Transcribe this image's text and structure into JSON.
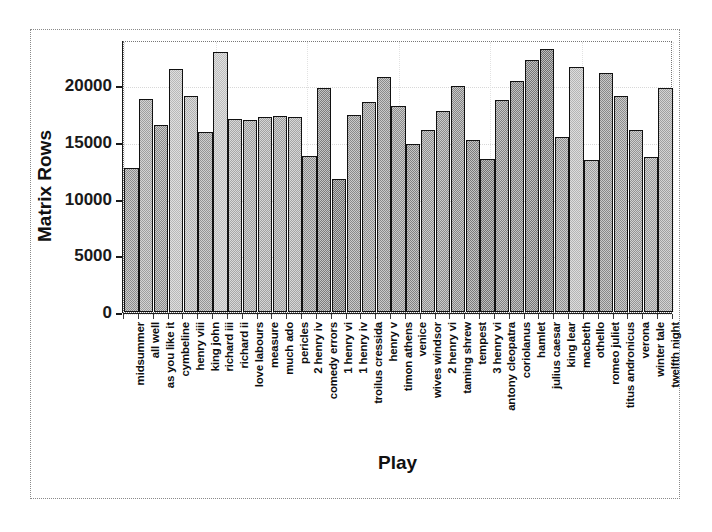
{
  "chart_data": {
    "type": "bar",
    "title": "",
    "xlabel": "Play",
    "ylabel": "Matrix Rows",
    "ylim": [
      0,
      24000
    ],
    "yticks": [
      0,
      5000,
      10000,
      15000,
      20000
    ],
    "ytick_labels": [
      "0",
      "5000",
      "10000",
      "15000",
      "20000"
    ],
    "grid": true,
    "legend": null,
    "categories": [
      "midsummer",
      "all well",
      "as you like it",
      "cymbeline",
      "henry viii",
      "king john",
      "richard iii",
      "richard ii",
      "love labours",
      "measure",
      "much ado",
      "pericles",
      "2 henry iv",
      "comedy errors",
      "1 henry vi",
      "1 henry iv",
      "troilus cressida",
      "henry v",
      "timon athens",
      "venice",
      "wives windsor",
      "2 henry vi",
      "taming shrew",
      "tempest",
      "3 henry vi",
      "antony cleopatra",
      "coriolanus",
      "hamlet",
      "julius caesar",
      "king lear",
      "macbeth",
      "othello",
      "romeo juliet",
      "titus andronicus",
      "verona",
      "winter tale",
      "twelfth night"
    ],
    "values": [
      12700,
      18800,
      16500,
      21400,
      19100,
      15900,
      22900,
      17000,
      16900,
      17200,
      17300,
      17200,
      13800,
      19800,
      11700,
      17400,
      18500,
      20700,
      18200,
      14800,
      16100,
      17700,
      19900,
      15200,
      13500,
      18700,
      20400,
      22200,
      23200,
      15400,
      21600,
      13400,
      21100,
      19100,
      16100,
      13700,
      19800
    ]
  },
  "style": {
    "bar_edge_color": "#111111",
    "bar_fill_colors": [
      "#8c8c8c",
      "#9e9e9e",
      "#8a8a8a",
      "#b8b8b8",
      "#b0b0b0",
      "#949494",
      "#bdbdbd",
      "#a8a8a8",
      "#9c9c9c",
      "#a2a2a2",
      "#9a9a9a",
      "#a6a6a6",
      "#8e8e8e",
      "#7e7e7e",
      "#6f6f6f",
      "#8a8a8a",
      "#8e8e8e",
      "#8a8a8a",
      "#8c8c8c",
      "#828282",
      "#8e8e8e",
      "#8a8a8a",
      "#868686",
      "#7c7c7c",
      "#747474",
      "#818181",
      "#7b7b7b",
      "#757575",
      "#6e6e6e",
      "#8f8f8f",
      "#b4b4b4",
      "#9b9b9b",
      "#888888",
      "#8c8c8c",
      "#949494",
      "#9a9a9a",
      "#a0a0a0"
    ],
    "frame_color": "#777777",
    "grid_color": "#d8d8d8",
    "text_color": "#111111",
    "background": "#ffffff"
  }
}
